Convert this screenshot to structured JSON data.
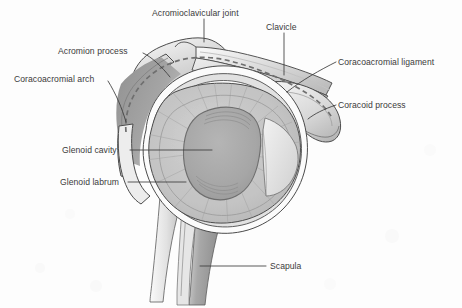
{
  "figure": {
    "width": 462,
    "height": 308,
    "background_color": "#fdfdfd",
    "text_color": "#3b3b3b",
    "leader_line_color": "#3b3b3b",
    "outline_color": "#4a4a4a",
    "style": "grayscale medical illustration"
  },
  "palette": {
    "background": "#fdfdfd",
    "bone_light": "#e9e9e9",
    "bone_mid": "#d2d2d2",
    "bone_shadow": "#9d9d9d",
    "bone_dark": "#7c7c7c",
    "cavity_fill": "#a9a9a9",
    "cavity_rim": "#8d8d8d",
    "labrum_fill": "#c6c6c6",
    "capsule_fill": "#bdbdbd",
    "highlight_white": "#fbfbfb",
    "clavicle_fill": "#dcdcdc",
    "scapula_fill": "#9a9a9a",
    "wedge_fill": "#e4e4e4",
    "dashed_line": "#6f6f6f"
  },
  "labels": [
    {
      "id": "acromioclavicular-joint",
      "text": "Acromioclavicular joint",
      "x": 152,
      "y": 8,
      "anchor": "top-center",
      "leader": "vertical down to joint apex"
    },
    {
      "id": "clavicle",
      "text": "Clavicle",
      "x": 266,
      "y": 22,
      "anchor": "top",
      "leader": "vertical down to clavicle shaft"
    },
    {
      "id": "acromion-process",
      "text": "Acromion process",
      "x": 58,
      "y": 46,
      "anchor": "left",
      "leader": "diagonal down-right to acromion"
    },
    {
      "id": "coracoacromial-ligament",
      "text": "Coracoacromial ligament",
      "x": 338,
      "y": 57,
      "anchor": "right",
      "leader": "diagonal down-left to dashed ligament"
    },
    {
      "id": "coracoacromial-arch",
      "text": "Coracoacromial arch",
      "x": 14,
      "y": 74,
      "anchor": "left",
      "leader": "diagonal down-right to dashed arch"
    },
    {
      "id": "coracoid-process",
      "text": "Coracoid process",
      "x": 338,
      "y": 100,
      "anchor": "right",
      "leader": "diagonal down-left to coracoid tip"
    },
    {
      "id": "glenoid-cavity",
      "text": "Glenoid cavity",
      "x": 62,
      "y": 145,
      "anchor": "left",
      "leader": "horizontal right into cavity centre"
    },
    {
      "id": "glenoid-labrum",
      "text": "Glenoid labrum",
      "x": 60,
      "y": 177,
      "anchor": "left",
      "leader": "horizontal right to labrum rim"
    },
    {
      "id": "scapula",
      "text": "Scapula",
      "x": 270,
      "y": 261,
      "anchor": "right",
      "leader": "horizontal left to scapula blade"
    }
  ],
  "structures": [
    {
      "id": "acromion",
      "name": "Acromion process"
    },
    {
      "id": "clavicle",
      "name": "Clavicle"
    },
    {
      "id": "acromioclavicular-joint",
      "name": "Acromioclavicular joint"
    },
    {
      "id": "coracoacromial-ligament",
      "name": "Coracoacromial ligament"
    },
    {
      "id": "coracoacromial-arch",
      "name": "Coracoacromial arch"
    },
    {
      "id": "coracoid-process",
      "name": "Coracoid process"
    },
    {
      "id": "glenoid-cavity",
      "name": "Glenoid cavity"
    },
    {
      "id": "glenoid-labrum",
      "name": "Glenoid labrum"
    },
    {
      "id": "joint-capsule",
      "name": "Joint capsule"
    },
    {
      "id": "scapula",
      "name": "Scapula"
    }
  ]
}
